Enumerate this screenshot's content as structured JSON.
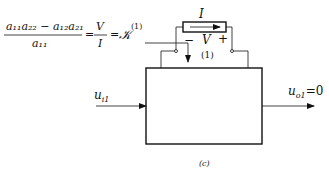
{
  "equation": {
    "numerator": "a₁₁a₂₂ − a₁₂a₂₁",
    "denominator": "a₁₁",
    "equals1": "=",
    "rhs_num": "V",
    "rhs_den": "I",
    "equals2": "=",
    "result": "𝒦",
    "superscript": "(1)"
  },
  "element": {
    "current_label": "I",
    "minus": "−",
    "voltage_label": "V",
    "plus": "+",
    "port_label": "(1)"
  },
  "input_label": "u",
  "input_sub": "i1",
  "output_label": "u",
  "output_sub": "o1",
  "output_value": "=0",
  "caption": "(c)"
}
